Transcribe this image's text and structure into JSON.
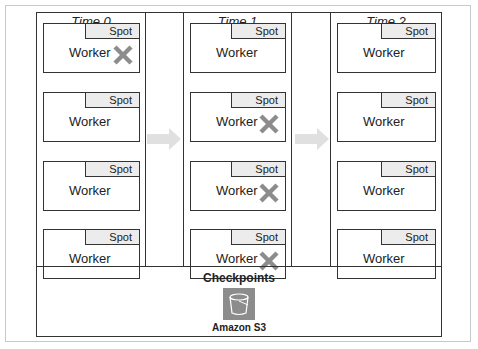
{
  "columns": [
    {
      "title": "Time 0",
      "cards": [
        {
          "tag": "Spot",
          "label": "Worker",
          "failed": true
        },
        {
          "tag": "Spot",
          "label": "Worker",
          "failed": false
        },
        {
          "tag": "Spot",
          "label": "Worker",
          "failed": false
        },
        {
          "tag": "Spot",
          "label": "Worker",
          "failed": false
        }
      ]
    },
    {
      "title": "Time 1",
      "cards": [
        {
          "tag": "Spot",
          "label": "Worker",
          "failed": false
        },
        {
          "tag": "Spot",
          "label": "Worker",
          "failed": true
        },
        {
          "tag": "Spot",
          "label": "Worker",
          "failed": true
        },
        {
          "tag": "Spot",
          "label": "Worker",
          "failed": true
        }
      ]
    },
    {
      "title": "Time 2",
      "cards": [
        {
          "tag": "Spot",
          "label": "Worker",
          "failed": false
        },
        {
          "tag": "Spot",
          "label": "Worker",
          "failed": false
        },
        {
          "tag": "Spot",
          "label": "Worker",
          "failed": false
        },
        {
          "tag": "Spot",
          "label": "Worker",
          "failed": false
        }
      ]
    }
  ],
  "checkpoints": {
    "title": "Checkpoints",
    "storage_label": "Amazon S3",
    "icon": "s3-bucket-icon"
  },
  "colors": {
    "border": "#333333",
    "spot_fill": "#ececec",
    "x_mark": "#8c8c8c",
    "arrow": "#e0e0e0"
  }
}
